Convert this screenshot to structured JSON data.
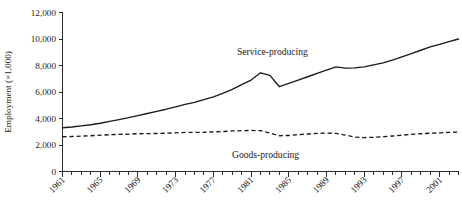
{
  "chart_data": {
    "type": "line",
    "title": "",
    "xlabel": "",
    "ylabel": "Employment (×1,000)",
    "ylim": [
      0,
      12000
    ],
    "xlim": [
      1961,
      2003
    ],
    "grid": false,
    "legend_position": "inline-annotation",
    "y_ticks": [
      "0",
      "2,000",
      "4,000",
      "6,000",
      "8,000",
      "10,000",
      "12,000"
    ],
    "y_tick_values": [
      0,
      2000,
      4000,
      6000,
      8000,
      10000,
      12000
    ],
    "x_ticks": [
      "1961",
      "1965",
      "1969",
      "1973",
      "1977",
      "1981",
      "1985",
      "1989",
      "1993",
      "1997",
      "2001"
    ],
    "x_tick_values": [
      1961,
      1965,
      1969,
      1973,
      1977,
      1981,
      1985,
      1989,
      1993,
      1997,
      2001
    ],
    "x_minor_interval": 1,
    "x": [
      1961,
      1962,
      1963,
      1964,
      1965,
      1966,
      1967,
      1968,
      1969,
      1970,
      1971,
      1972,
      1973,
      1974,
      1975,
      1976,
      1977,
      1978,
      1979,
      1980,
      1981,
      1982,
      1983,
      1984,
      1985,
      1986,
      1987,
      1988,
      1989,
      1990,
      1991,
      1992,
      1993,
      1994,
      1995,
      1996,
      1997,
      1998,
      1999,
      2000,
      2001,
      2002,
      2003
    ],
    "series": [
      {
        "name": "Service-producing",
        "style": "solid",
        "label_text": "Service-producing",
        "values": [
          3300,
          3360,
          3440,
          3530,
          3640,
          3780,
          3920,
          4060,
          4220,
          4380,
          4540,
          4700,
          4880,
          5060,
          5220,
          5420,
          5640,
          5900,
          6200,
          6550,
          6900,
          7450,
          7250,
          6400,
          6650,
          6900,
          7150,
          7400,
          7650,
          7900,
          7800,
          7820,
          7900,
          8050,
          8200,
          8400,
          8650,
          8900,
          9150,
          9400,
          9600,
          9800,
          10000
        ]
      },
      {
        "name": "Goods-producing",
        "style": "dashed",
        "label_text": "Goods-producing",
        "values": [
          2620,
          2640,
          2670,
          2700,
          2740,
          2780,
          2800,
          2820,
          2850,
          2860,
          2870,
          2890,
          2920,
          2950,
          2950,
          2960,
          2990,
          3020,
          3060,
          3080,
          3100,
          3080,
          2900,
          2700,
          2720,
          2780,
          2830,
          2880,
          2900,
          2880,
          2750,
          2600,
          2560,
          2580,
          2620,
          2680,
          2740,
          2800,
          2850,
          2890,
          2920,
          2950,
          2980
        ]
      }
    ]
  },
  "annotations": {
    "service_label": "Service-producing",
    "goods_label": "Goods-producing"
  }
}
